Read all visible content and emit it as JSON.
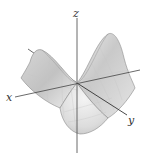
{
  "diagram": {
    "type": "3d-surface",
    "surface": "saddle (hyperbolic paraboloid)",
    "axes": {
      "x": {
        "label": "x"
      },
      "y": {
        "label": "y"
      },
      "z": {
        "label": "z"
      }
    },
    "colors": {
      "axis": "#444444",
      "surface_light": "#f2f2f2",
      "surface_mid": "#d4d4d4",
      "surface_dark": "#a8a8a8",
      "edge": "#8a8a8a",
      "grid": "#c8c8c8"
    }
  }
}
